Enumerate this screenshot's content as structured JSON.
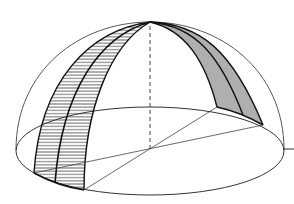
{
  "figure": {
    "title": "Hemisphere with two shaded meridian bands",
    "colors": {
      "stroke": "#222222",
      "hatch": "#333333",
      "background": "#ffffff"
    }
  },
  "geometry": {
    "apex": [
      150,
      22
    ],
    "base_center": [
      150,
      150
    ],
    "base_ellipse": {
      "cx": 150,
      "cy": 151,
      "rx": 134,
      "ry": 44
    },
    "left_band_feet": [
      [
        34,
        173
      ],
      [
        55,
        183
      ],
      [
        84,
        190
      ]
    ],
    "right_band_feet": [
      [
        217,
        107
      ],
      [
        243,
        115
      ],
      [
        263,
        125
      ]
    ],
    "tick_line": [
      [
        283,
        149
      ],
      [
        294,
        149
      ]
    ]
  }
}
